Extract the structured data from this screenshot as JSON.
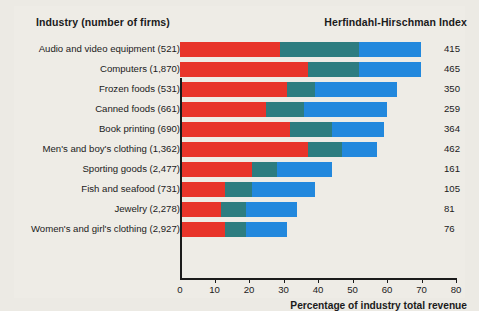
{
  "header": {
    "industry_label": "Industry (number of firms)",
    "hhi_label": "Herfindahl-Hirschman Index"
  },
  "axis": {
    "title": "Percentage of industry total revenue",
    "ticks": [
      "0",
      "10",
      "20",
      "30",
      "40",
      "50",
      "60",
      "70",
      "80"
    ]
  },
  "legend": {
    "items": [
      {
        "label": "4 largest firms",
        "color": "#e8342a"
      },
      {
        "label": "Next 4 largest firms",
        "color": "#2d7d80"
      },
      {
        "label": "Next 12 largest firms",
        "color": "#2288dd"
      }
    ]
  },
  "rows": [
    {
      "label": "Audio and video equipment  (521)",
      "hhi": "415"
    },
    {
      "label": "Computers  (1,870)",
      "hhi": "465"
    },
    {
      "label": "Frozen foods  (531)",
      "hhi": "350"
    },
    {
      "label": "Canned foods  (661)",
      "hhi": "259"
    },
    {
      "label": "Book printing  (690)",
      "hhi": "364"
    },
    {
      "label": "Men's and boy's clothing  (1,362)",
      "hhi": "462"
    },
    {
      "label": "Sporting goods  (2,477)",
      "hhi": "161"
    },
    {
      "label": "Fish and seafood  (731)",
      "hhi": "105"
    },
    {
      "label": "Jewelry  (2,278)",
      "hhi": "81"
    },
    {
      "label": "Women's and girl's clothing  (2,927)",
      "hhi": "76"
    }
  ],
  "chart_data": {
    "type": "bar",
    "title": "",
    "orientation": "horizontal",
    "stacked": true,
    "xlabel": "Percentage of industry total revenue",
    "ylabel": "Industry (number of firms)",
    "xlim": [
      0,
      80
    ],
    "xticks": [
      0,
      10,
      20,
      30,
      40,
      50,
      60,
      70,
      80
    ],
    "grid": false,
    "legend_position": "bottom",
    "categories": [
      "Audio and video equipment  (521)",
      "Computers  (1,870)",
      "Frozen foods  (531)",
      "Canned foods  (661)",
      "Book printing  (690)",
      "Men's and boy's clothing  (1,362)",
      "Sporting goods  (2,477)",
      "Fish and seafood  (731)",
      "Jewelry  (2,278)",
      "Women's and girl's clothing  (2,927)"
    ],
    "series": [
      {
        "name": "4 largest firms",
        "color": "#e8342a",
        "values": [
          29,
          37,
          31,
          25,
          32,
          37,
          21,
          13,
          12,
          13
        ]
      },
      {
        "name": "Next 4 largest firms",
        "color": "#2d7d80",
        "values": [
          23,
          15,
          8,
          11,
          12,
          10,
          7,
          8,
          7,
          6
        ]
      },
      {
        "name": "Next 12 largest firms",
        "color": "#2288dd",
        "values": [
          18,
          18,
          24,
          24,
          15,
          10,
          16,
          18,
          15,
          12
        ]
      }
    ],
    "cumulative_totals": [
      70,
      70,
      63,
      60,
      59,
      57,
      44,
      39,
      34,
      31
    ],
    "annotations": {
      "name": "Herfindahl-Hirschman Index",
      "values": [
        415,
        465,
        350,
        259,
        364,
        462,
        161,
        105,
        81,
        76
      ]
    }
  }
}
